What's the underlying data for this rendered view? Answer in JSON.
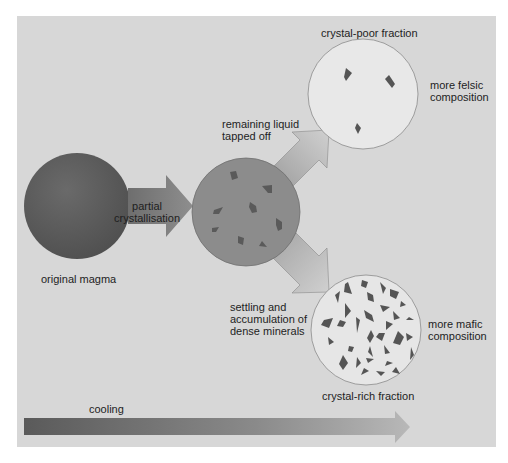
{
  "diagram": {
    "title": "",
    "labels": {
      "original_magma": "original magma",
      "partial_crystallisation": "partial\ncrystallisation",
      "remaining_liquid": "remaining liquid\ntapped off",
      "crystal_poor_fraction": "crystal-poor fraction",
      "more_felsic": "more felsic\ncomposition",
      "settling": "settling and\naccumulation of\ndense minerals",
      "more_mafic": "more mafic\ncomposition",
      "crystal_rich_fraction": "crystal-rich fraction",
      "cooling": "cooling"
    },
    "nodes": [
      {
        "id": "original-magma",
        "label": "original magma"
      },
      {
        "id": "partially-crystallised-magma",
        "label": ""
      },
      {
        "id": "crystal-poor-fraction",
        "label": "crystal-poor fraction",
        "note": "more felsic composition"
      },
      {
        "id": "crystal-rich-fraction",
        "label": "crystal-rich fraction",
        "note": "more mafic composition"
      }
    ],
    "edges": [
      {
        "from": "original-magma",
        "to": "partially-crystallised-magma",
        "label": "partial crystallisation"
      },
      {
        "from": "partially-crystallised-magma",
        "to": "crystal-poor-fraction",
        "label": "remaining liquid tapped off"
      },
      {
        "from": "partially-crystallised-magma",
        "to": "crystal-rich-fraction",
        "label": "settling and accumulation of dense minerals"
      }
    ],
    "axis_arrow": {
      "label": "cooling"
    },
    "colors": {
      "panel": "#d7d7d7",
      "original_magma": "#5e5e5e",
      "middle_magma": "#8c8c8c",
      "fraction_fill": "#e6e6e6",
      "crystal": "#555555"
    }
  }
}
